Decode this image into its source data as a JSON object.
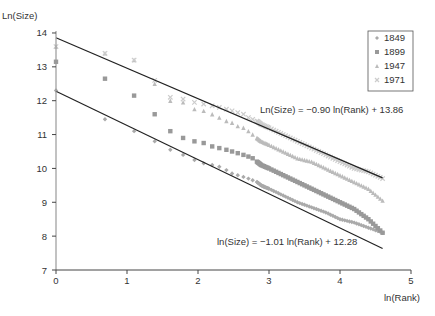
{
  "chart_data": {
    "type": "scatter",
    "title": "",
    "xlabel": "ln(Rank)",
    "ylabel": "Ln(Size)",
    "xlim": [
      0,
      5
    ],
    "ylim": [
      7,
      14
    ],
    "xticks": [
      "0",
      "1",
      "2",
      "3",
      "4",
      "5"
    ],
    "yticks": [
      "7",
      "8",
      "9",
      "10",
      "11",
      "12",
      "13",
      "14"
    ],
    "grid": false,
    "legend_position": "top-right",
    "legend": [
      "1849",
      "1899",
      "1947",
      "1971"
    ],
    "series": [
      {
        "name": "1849",
        "marker": "diamond",
        "color": "#aaaaaa",
        "x": [
          0,
          0.69,
          1.1,
          1.39,
          1.61,
          1.79,
          1.95,
          2.08,
          2.2,
          2.3,
          2.4,
          2.48,
          2.56,
          2.64,
          2.71,
          2.77,
          2.83,
          2.89,
          2.94,
          3.0,
          3.2,
          3.4,
          3.6,
          3.8,
          4.0,
          4.2,
          4.4,
          4.6
        ],
        "y": [
          12.3,
          11.45,
          11.1,
          10.8,
          10.55,
          10.4,
          10.25,
          10.15,
          10.1,
          10.05,
          9.95,
          9.85,
          9.8,
          9.75,
          9.7,
          9.65,
          9.6,
          9.5,
          9.45,
          9.4,
          9.2,
          9.0,
          8.85,
          8.7,
          8.5,
          8.4,
          8.25,
          8.1
        ]
      },
      {
        "name": "1899",
        "marker": "square",
        "color": "#999999",
        "x": [
          0,
          0.69,
          1.1,
          1.39,
          1.61,
          1.79,
          1.95,
          2.08,
          2.2,
          2.3,
          2.4,
          2.48,
          2.56,
          2.64,
          2.71,
          2.77,
          2.83,
          2.89,
          3.0,
          3.2,
          3.4,
          3.6,
          3.8,
          4.0,
          4.2,
          4.4,
          4.6
        ],
        "y": [
          13.15,
          12.65,
          12.15,
          11.6,
          11.1,
          10.9,
          10.8,
          10.75,
          10.65,
          10.6,
          10.55,
          10.5,
          10.45,
          10.4,
          10.35,
          10.3,
          10.2,
          10.1,
          10.0,
          9.8,
          9.6,
          9.4,
          9.2,
          9.0,
          8.8,
          8.5,
          8.1
        ]
      },
      {
        "name": "1947",
        "marker": "triangle",
        "color": "#bbbbbb",
        "x": [
          0,
          0.69,
          1.1,
          1.39,
          1.61,
          1.79,
          1.95,
          2.08,
          2.2,
          2.3,
          2.4,
          2.48,
          2.56,
          2.64,
          2.71,
          2.77,
          2.83,
          2.89,
          3.0,
          3.2,
          3.4,
          3.6,
          3.8,
          4.0,
          4.2,
          4.4,
          4.6
        ],
        "y": [
          13.6,
          13.4,
          13.2,
          12.5,
          12.0,
          11.95,
          11.75,
          11.7,
          11.6,
          11.5,
          11.4,
          11.35,
          11.25,
          11.2,
          11.1,
          11.0,
          10.9,
          10.8,
          10.7,
          10.5,
          10.3,
          10.2,
          10.0,
          9.8,
          9.6,
          9.4,
          9.05
        ]
      },
      {
        "name": "1971",
        "marker": "x",
        "color": "#cccccc",
        "x": [
          0,
          0.69,
          1.1,
          1.39,
          1.61,
          1.79,
          1.95,
          2.08,
          2.2,
          2.3,
          2.4,
          2.48,
          2.56,
          2.64,
          2.71,
          2.77,
          2.83,
          2.89,
          3.0,
          3.2,
          3.4,
          3.6,
          3.8,
          4.0,
          4.2,
          4.4,
          4.6
        ],
        "y": [
          13.6,
          13.4,
          13.2,
          12.6,
          12.1,
          12.05,
          11.95,
          11.9,
          11.85,
          11.8,
          11.75,
          11.7,
          11.65,
          11.6,
          11.5,
          11.45,
          11.4,
          11.3,
          11.2,
          11.0,
          10.8,
          10.6,
          10.4,
          10.2,
          10.0,
          9.9,
          9.7
        ]
      }
    ],
    "fit_lines": [
      {
        "label": "Ln(Size) = −0.90 ln(Rank) + 13.86",
        "slope": -0.9,
        "intercept": 13.86,
        "x_range": [
          0,
          4.6
        ]
      },
      {
        "label": "ln(Size) = −1.01 ln(Rank) + 12.28",
        "slope": -1.01,
        "intercept": 12.28,
        "x_range": [
          0,
          4.6
        ]
      }
    ]
  }
}
